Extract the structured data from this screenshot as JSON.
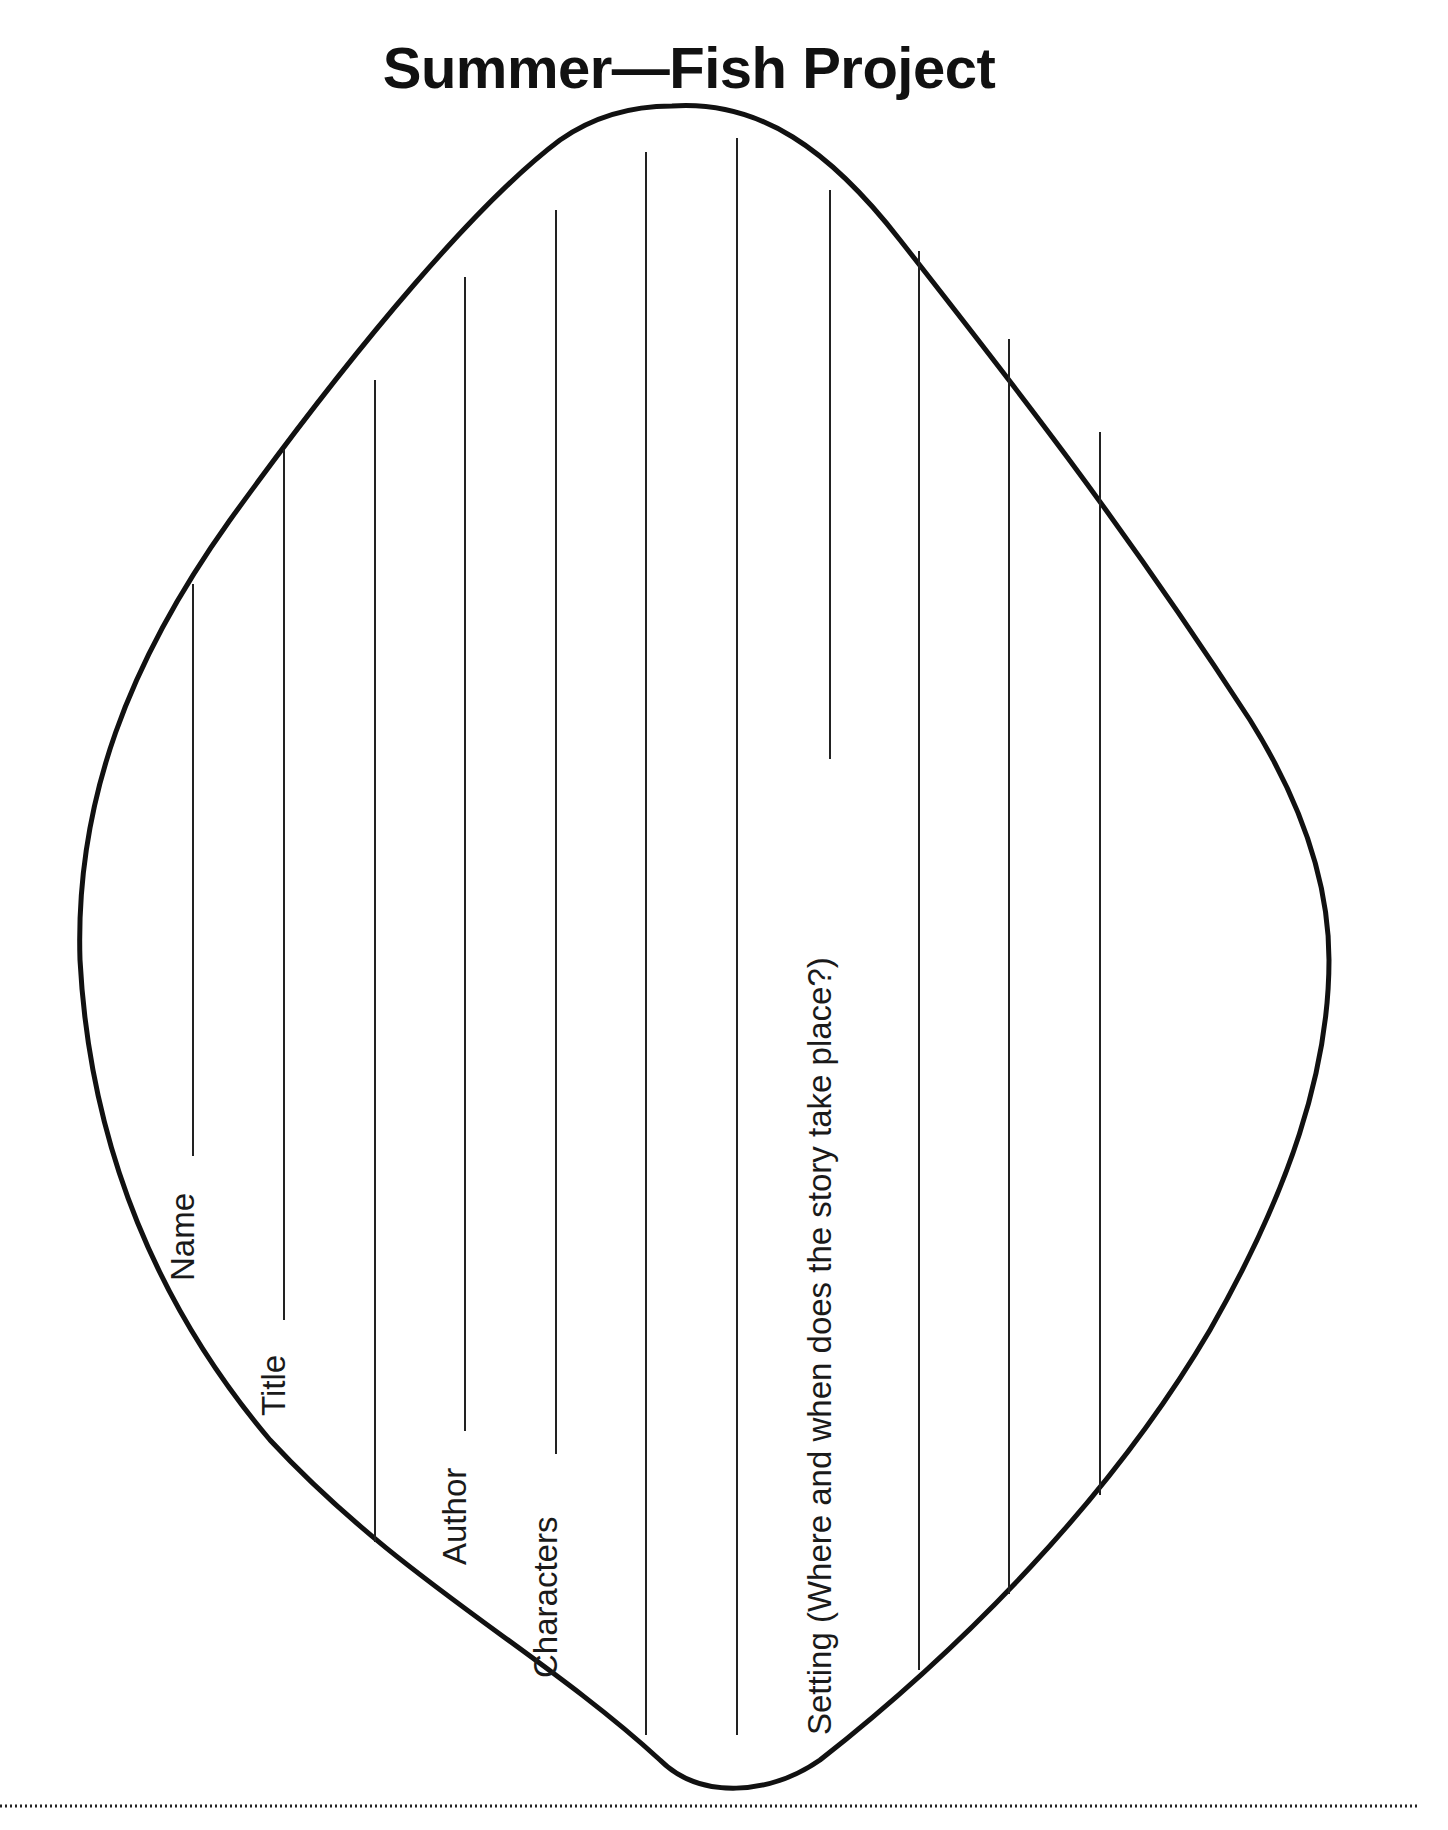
{
  "title": "Summer—Fish Project",
  "labels": {
    "name": "Name",
    "title": "Title",
    "author": "Author",
    "characters": "Characters",
    "setting": "Setting (Where and when does the story take place?)"
  },
  "colors": {
    "ink": "#111111",
    "background": "#ffffff"
  },
  "shape": "fish-body-outline",
  "writing_lines_count": 11,
  "footer": {
    "separator": "dotted-line",
    "text_visible": false
  }
}
